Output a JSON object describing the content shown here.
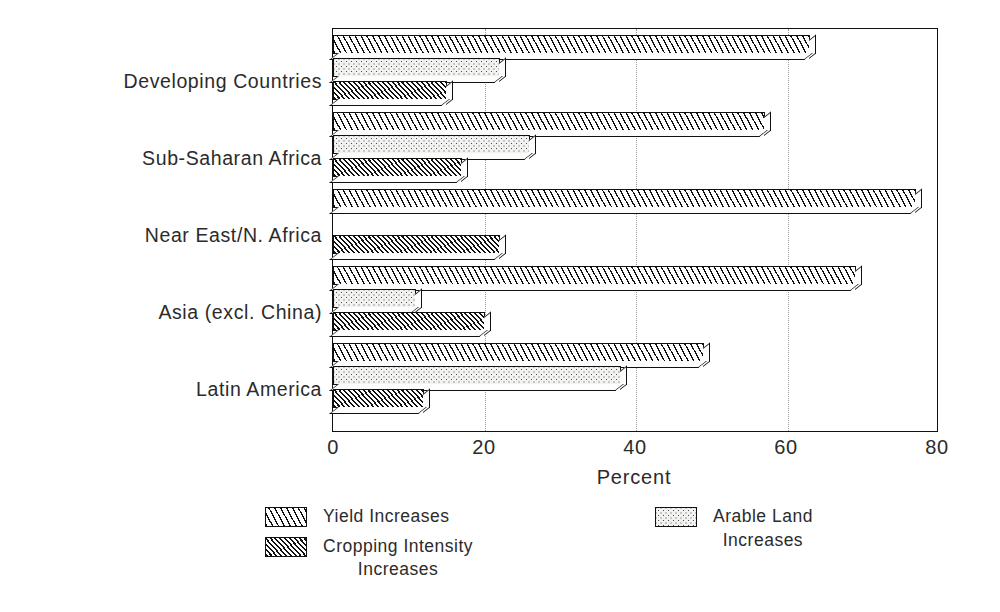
{
  "chart_data": {
    "type": "bar",
    "orientation": "horizontal",
    "title": "",
    "subtitle": "",
    "xlabel": "Percent",
    "ylabel": "",
    "xlim": [
      0,
      80
    ],
    "xticks": [
      0,
      20,
      40,
      60,
      80
    ],
    "xtick_labels": [
      "0",
      "20",
      "40",
      "60",
      "80"
    ],
    "grid": true,
    "grid_axis": "x",
    "grid_style": "dotted",
    "legend_position": "below",
    "categories": [
      "Developing Countries",
      "Sub-Saharan Africa",
      "Near East/N. Africa",
      "Asia (excl. China)",
      "Latin America"
    ],
    "series": [
      {
        "name": "Yield Increases",
        "fill": "diagonal-hatch-wide",
        "values": [
          63,
          57,
          77,
          69,
          49
        ]
      },
      {
        "name": "Arable Land Increases",
        "fill": "stipple-dots",
        "values": [
          22,
          26,
          0,
          11,
          38
        ]
      },
      {
        "name": "Cropping Intensity Increases",
        "fill": "diagonal-hatch-dense",
        "values": [
          15,
          17,
          22,
          20,
          12
        ]
      }
    ]
  },
  "axis": {
    "x_title": "Percent",
    "tick_labels": [
      "0",
      "20",
      "40",
      "60",
      "80"
    ]
  },
  "categories": [
    {
      "label": "Developing Countries"
    },
    {
      "label": "Sub-Saharan Africa"
    },
    {
      "label": "Near East/N. Africa"
    },
    {
      "label": "Asia (excl. China)"
    },
    {
      "label": "Latin America"
    }
  ],
  "legend": {
    "items": [
      {
        "label": "Yield Increases",
        "line1": "Yield Increases",
        "line2": "",
        "swatch": "diagonal-hatch-wide"
      },
      {
        "label": "Cropping Intensity Increases",
        "line1": "Cropping Intensity",
        "line2": "Increases",
        "swatch": "diagonal-hatch-dense"
      },
      {
        "label": "Arable Land Increases",
        "line1": "Arable Land",
        "line2": "Increases",
        "swatch": "stipple-dots"
      }
    ]
  },
  "colors": {
    "ink": "#111111",
    "paper": "#ffffff",
    "grid": "#9a9a9a",
    "stipple_base": "#f2f2f0"
  }
}
